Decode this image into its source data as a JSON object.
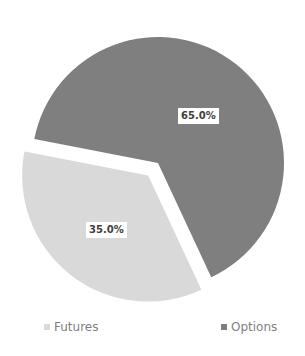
{
  "chart_data": {
    "type": "pie",
    "title": "",
    "categories": [
      "Futures",
      "Options"
    ],
    "values": [
      35.0,
      65.0
    ],
    "labels": [
      "35.0%",
      "65.0%"
    ],
    "colors": [
      "#d9d9d9",
      "#7f7f7f"
    ],
    "exploded": [
      "Futures"
    ],
    "legend_position": "bottom"
  },
  "legend": {
    "items": [
      {
        "label": "Futures",
        "color": "#d9d9d9"
      },
      {
        "label": "Options",
        "color": "#7f7f7f"
      }
    ]
  }
}
